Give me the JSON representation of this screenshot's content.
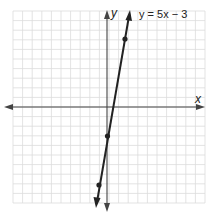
{
  "figure": {
    "equation_label": "y = 5x − 3",
    "x_axis_label": "x",
    "y_axis_label": "y",
    "colors": {
      "grid": "#d9d9d9",
      "axis": "#333333",
      "line": "#222222",
      "point": "#222222"
    }
  },
  "chart_data": {
    "type": "line",
    "title": "y = 5x − 3",
    "xlabel": "x",
    "ylabel": "y",
    "xlim": [
      -10,
      10
    ],
    "ylim": [
      -10,
      10
    ],
    "grid": true,
    "series": [
      {
        "name": "y = 5x − 3",
        "points": [
          [
            -1,
            -8
          ],
          [
            0,
            -3
          ],
          [
            2,
            7
          ]
        ]
      }
    ]
  }
}
